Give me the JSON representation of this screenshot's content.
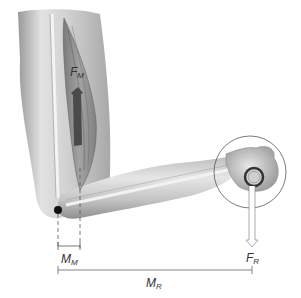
{
  "diagram": {
    "labels": {
      "muscle_force": {
        "main": "F",
        "sub": "M"
      },
      "resistance_force": {
        "main": "F",
        "sub": "R"
      },
      "muscle_moment_arm": {
        "main": "M",
        "sub": "M"
      },
      "resistance_moment_arm": {
        "main": "M",
        "sub": "R"
      }
    },
    "colors": {
      "skin_light": "#e6e6e6",
      "skin_mid": "#c8c8c8",
      "skin_dark": "#8a8a8a",
      "muscle": "#6e6e6e",
      "arrow_muscle": "#4a4a4a",
      "line": "#555555",
      "pivot": "#111111"
    }
  }
}
